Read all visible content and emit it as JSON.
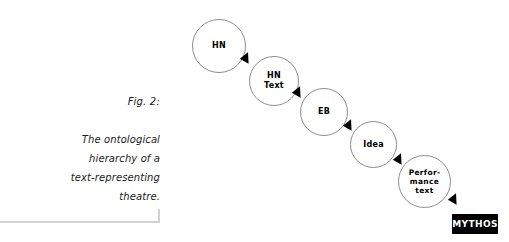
{
  "figure": {
    "number_label": "Fig. 2:",
    "caption_lines": [
      "The ontological",
      "hierarchy of a",
      "text-representing",
      "theatre."
    ]
  },
  "diagram": {
    "type": "flow-chain",
    "nodes": [
      {
        "id": "hn",
        "label": "HN"
      },
      {
        "id": "hn-text",
        "label": "HN\nText"
      },
      {
        "id": "eb",
        "label": "EB"
      },
      {
        "id": "idea",
        "label": "Idea"
      },
      {
        "id": "performance",
        "label": "Perfor-\nmance\ntext"
      }
    ],
    "arrows": [
      {
        "from": "hn",
        "to": "hn-text"
      },
      {
        "from": "hn-text",
        "to": "eb"
      },
      {
        "from": "eb",
        "to": "idea"
      },
      {
        "from": "idea",
        "to": "performance"
      },
      {
        "from": "performance",
        "to": "mythos"
      }
    ]
  },
  "badge": {
    "label": "MYTHOS"
  },
  "colors": {
    "background": "#ffffff",
    "circle_stroke": "#8d8d8d",
    "text": "#1a1a1a",
    "rule": "#d2d2d2",
    "badge_bg": "#000000",
    "badge_text": "#ffffff"
  }
}
